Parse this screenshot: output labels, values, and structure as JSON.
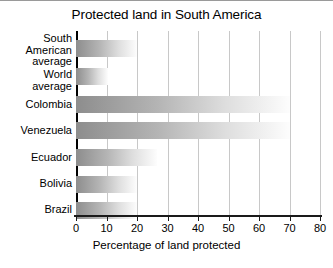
{
  "chart_data": {
    "type": "bar",
    "orientation": "horizontal",
    "title": "Protected land in South America",
    "xlabel": "Percentage of land protected",
    "ylabel": "",
    "xlim": [
      0,
      80
    ],
    "xticks": [
      0,
      10,
      20,
      30,
      40,
      50,
      60,
      70,
      80
    ],
    "xtick_labels": [
      "0",
      "10",
      "20",
      "30",
      "40",
      "50",
      "60",
      "70",
      "80"
    ],
    "grid": true,
    "grid_axis": "x",
    "legend": false,
    "categories": [
      "South\nAmerican\naverage",
      "World\naverage",
      "Colombia",
      "Venezuela",
      "Ecuador",
      "Bolivia",
      "Brazil"
    ],
    "values": [
      20,
      10.5,
      70,
      70,
      26.5,
      20,
      20
    ],
    "bar_style": {
      "fill": "horizontal-gradient",
      "gradient_start": "#8d8d8d",
      "gradient_end": "#fdfdfd"
    },
    "axis_color": "#1a1a1a",
    "gridline_color": "#c8c8c8",
    "background": "#ffffff"
  }
}
